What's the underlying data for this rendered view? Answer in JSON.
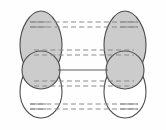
{
  "figure": {
    "caption": "",
    "width_px": 166,
    "height_px": 130,
    "background_color": "#fefefe"
  },
  "palette": {
    "lobe_fill_shaded": "#cccccc",
    "lobe_fill_empty": "#ffffff",
    "outline": "#4d4d4d",
    "dash_line": "#8a8a8a",
    "solid_line": "#5a5a5a",
    "frame": "#dedede"
  },
  "fragments": [
    {
      "id": "left-fragment",
      "side": "left",
      "center_x": 41,
      "orbitals": [
        {
          "id": "left-upper-lobe",
          "shape": "teardrop",
          "direction": "up",
          "phase": "shaded",
          "fill": "#cccccc",
          "cx": 41,
          "cy": 29,
          "rx": 21,
          "ry": 20
        },
        {
          "id": "left-center-circle",
          "shape": "circle",
          "phase": "shaded",
          "fill": "#cccccc",
          "cx": 41,
          "cy": 70,
          "r": 19
        },
        {
          "id": "left-lower-lobe",
          "shape": "teardrop",
          "direction": "down",
          "phase": "empty",
          "fill": "#ffffff",
          "cx": 41,
          "cy": 101,
          "rx": 21,
          "ry": 20
        }
      ]
    },
    {
      "id": "right-fragment",
      "side": "right",
      "center_x": 125,
      "orbitals": [
        {
          "id": "right-upper-lobe",
          "shape": "teardrop",
          "direction": "up",
          "phase": "shaded",
          "fill": "#cccccc",
          "cx": 125,
          "cy": 29,
          "rx": 21,
          "ry": 20
        },
        {
          "id": "right-center-circle",
          "shape": "circle",
          "phase": "shaded",
          "fill": "#cccccc",
          "cx": 125,
          "cy": 70,
          "r": 19
        },
        {
          "id": "right-lower-lobe",
          "shape": "teardrop",
          "direction": "down",
          "phase": "empty",
          "fill": "#ffffff",
          "cx": 125,
          "cy": 101,
          "rx": 21,
          "ry": 20
        }
      ]
    }
  ],
  "connectors": [
    {
      "id": "interaction-1-upper",
      "style": "dashed",
      "y": 22,
      "x1": 30,
      "x2": 138,
      "color": "#8a8a8a"
    },
    {
      "id": "interaction-2-upper",
      "style": "dashed",
      "y": 27,
      "x1": 30,
      "x2": 138,
      "color": "#8a8a8a"
    },
    {
      "id": "interaction-3-mid-upper",
      "style": "dashed",
      "y": 50,
      "x1": 34,
      "x2": 134,
      "color": "#8a8a8a"
    },
    {
      "id": "interaction-4-mid-upper",
      "style": "dashed",
      "y": 55,
      "x1": 34,
      "x2": 134,
      "color": "#8a8a8a"
    },
    {
      "id": "bond-solid-center",
      "style": "solid",
      "y": 70,
      "x1": 58,
      "x2": 108,
      "color": "#5a5a5a"
    },
    {
      "id": "interaction-5-mid-lower",
      "style": "dashed",
      "y": 81,
      "x1": 34,
      "x2": 134,
      "color": "#8a8a8a"
    },
    {
      "id": "interaction-6-mid-lower",
      "style": "dashed",
      "y": 86,
      "x1": 34,
      "x2": 134,
      "color": "#8a8a8a"
    },
    {
      "id": "interaction-7-lower",
      "style": "dashed",
      "y": 104,
      "x1": 30,
      "x2": 138,
      "color": "#8a8a8a"
    },
    {
      "id": "interaction-8-lower",
      "style": "dashed",
      "y": 109,
      "x1": 30,
      "x2": 138,
      "color": "#8a8a8a"
    }
  ],
  "labels": []
}
